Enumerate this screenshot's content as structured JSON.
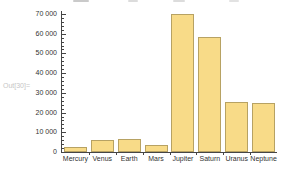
{
  "notebook": {
    "output_label": "Out[30]=",
    "output_label_color": "#c6c6c6"
  },
  "chart_data": {
    "type": "bar",
    "title": "",
    "xlabel": "",
    "ylabel": "",
    "categories": [
      "Mercury",
      "Venus",
      "Earth",
      "Mars",
      "Jupiter",
      "Saturn",
      "Uranus",
      "Neptune"
    ],
    "values": [
      2440,
      6052,
      6371,
      3390,
      69911,
      58232,
      25362,
      24622
    ],
    "ylim": [
      0,
      70000
    ],
    "yticks": [
      0,
      10000,
      20000,
      30000,
      40000,
      50000,
      60000,
      70000
    ],
    "ytick_labels": [
      "0",
      "10 000",
      "20 000",
      "30 000",
      "40 000",
      "50 000",
      "60 000",
      "70 000"
    ],
    "minor_tick_step": 2000,
    "grid": false,
    "legend": false,
    "bar_fill": "#F8DB88",
    "bar_edge": "#B7A263",
    "axis_color": "#454545",
    "tick_label_color": "#333333"
  }
}
